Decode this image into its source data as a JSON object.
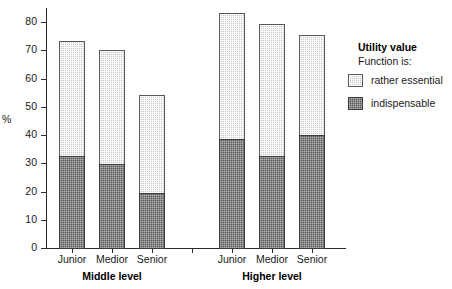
{
  "chart_data": {
    "type": "bar",
    "subtype": "stacked-bar-grouped",
    "title": "",
    "xlabel": "",
    "ylabel": "%",
    "ylim": [
      0,
      85
    ],
    "yticks": [
      0,
      10,
      20,
      30,
      40,
      50,
      60,
      70,
      80
    ],
    "grid": false,
    "categories": [
      "Junior",
      "Medior",
      "Senior",
      "Junior",
      "Medior",
      "Senior"
    ],
    "groups": [
      {
        "label": "Middle level",
        "categories": [
          "Junior",
          "Medior",
          "Senior"
        ]
      },
      {
        "label": "Higher level",
        "categories": [
          "Junior",
          "Medior",
          "Senior"
        ]
      }
    ],
    "series": [
      {
        "name": "indispensable",
        "color": "#585858",
        "values": [
          33,
          30,
          20,
          39,
          33,
          40.5
        ]
      },
      {
        "name": "rather essential",
        "color": "#c9c9c9",
        "values": [
          41,
          41,
          35,
          45,
          47,
          35.5
        ]
      }
    ],
    "totals": [
      74,
      71,
      55,
      84,
      80,
      76
    ],
    "legend": {
      "position": "right",
      "title": "Utility value",
      "subtitle": "Function is:",
      "entries": [
        {
          "label": "rather essential",
          "swatch": "light"
        },
        {
          "label": "indispensable",
          "swatch": "dark"
        }
      ]
    }
  }
}
